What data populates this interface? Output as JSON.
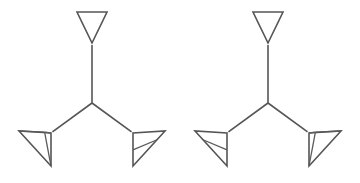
{
  "figure": {
    "background_color": "#ffffff",
    "stroke_color": "#555555",
    "stroke_width": 1.6,
    "width": 360,
    "height": 183,
    "count": 2,
    "caption": "",
    "labels": []
  },
  "chart_data": {
    "type": "diagram",
    "xlabel": "",
    "ylabel": "",
    "grid": false,
    "legend": "none",
    "xlim": [
      0,
      360
    ],
    "ylim": [
      0,
      183
    ],
    "shapes": [
      {
        "name": "left-figure",
        "kind": "tripod-wireframe",
        "handedness": "left",
        "center_junction": [
          92,
          103
        ],
        "branches": [
          {
            "name": "top-branch",
            "from": [
              92,
              103
            ],
            "to": [
              92,
              43
            ]
          },
          {
            "name": "lower-left-branch",
            "from": [
              92,
              103
            ],
            "to": [
              51,
              133
            ]
          },
          {
            "name": "lower-right-branch",
            "from": [
              92,
              103
            ],
            "to": [
              133,
              133
            ]
          }
        ],
        "cones": [
          {
            "name": "top-cone",
            "apex": [
              92,
              43
            ],
            "rim_left": [
              77,
              12
            ],
            "rim_right": [
              107,
              12
            ],
            "detailed": false,
            "internal_lines": 0
          },
          {
            "name": "lower-left-cone",
            "apex": [
              51,
              133
            ],
            "rim_left": [
              19,
              131
            ],
            "rim_right": [
              51,
              166
            ],
            "detailed": true,
            "internal_lines": 2
          },
          {
            "name": "lower-right-cone",
            "apex": [
              133,
              133
            ],
            "rim_left": [
              165,
              131
            ],
            "rim_right": [
              133,
              166
            ],
            "detailed": false,
            "internal_lines": 1
          }
        ]
      },
      {
        "name": "right-figure",
        "kind": "tripod-wireframe",
        "handedness": "right",
        "center_junction": [
          268,
          103
        ],
        "branches": [
          {
            "name": "top-branch",
            "from": [
              268,
              103
            ],
            "to": [
              268,
              43
            ]
          },
          {
            "name": "lower-left-branch",
            "from": [
              268,
              103
            ],
            "to": [
              227,
              133
            ]
          },
          {
            "name": "lower-right-branch",
            "from": [
              268,
              103
            ],
            "to": [
              309,
              133
            ]
          }
        ],
        "cones": [
          {
            "name": "top-cone",
            "apex": [
              268,
              43
            ],
            "rim_left": [
              253,
              12
            ],
            "rim_right": [
              283,
              12
            ],
            "detailed": false,
            "internal_lines": 0
          },
          {
            "name": "lower-left-cone",
            "apex": [
              227,
              133
            ],
            "rim_left": [
              195,
              131
            ],
            "rim_right": [
              227,
              166
            ],
            "detailed": false,
            "internal_lines": 1
          },
          {
            "name": "lower-right-cone",
            "apex": [
              309,
              133
            ],
            "rim_left": [
              341,
              131
            ],
            "rim_right": [
              309,
              166
            ],
            "detailed": true,
            "internal_lines": 2
          }
        ]
      }
    ]
  }
}
